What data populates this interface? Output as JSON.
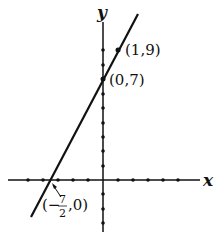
{
  "diagram": {
    "type": "line-graph",
    "axes": {
      "x_label": "x",
      "y_label": "y"
    },
    "line": {
      "equation": "y = 2x + 7",
      "color": "#111111"
    },
    "points": [
      {
        "label": "(1,9)",
        "x": 1,
        "y": 9
      },
      {
        "label": "(0,7)",
        "x": 0,
        "y": 7
      },
      {
        "label_parts": {
          "open": "(−",
          "num": "7",
          "den": "2",
          "close": ",0)"
        },
        "x": -3.5,
        "y": 0
      }
    ]
  }
}
